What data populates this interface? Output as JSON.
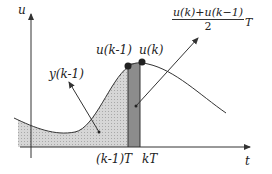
{
  "labels": {
    "y_axis": "u",
    "x_axis": "t",
    "u_k_minus_1": "u(k-1)",
    "u_k": "u(k)",
    "y_k_minus_1": "y(k-1)",
    "tick_k_minus_1": "(k-1)T",
    "tick_k": "kT",
    "formula_numerator": "u(k)+u(k−1)",
    "formula_denominator": "2",
    "formula_suffix": "T"
  },
  "colors": {
    "light_fill": "#cfcfcf",
    "dark_fill": "#8a8a8a",
    "line": "#333333"
  }
}
